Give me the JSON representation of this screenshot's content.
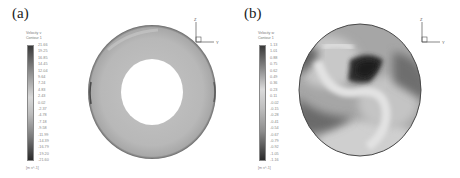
{
  "figure": {
    "panels": [
      {
        "label": "(a)",
        "legend": {
          "title_line1": "Velocity v",
          "title_line2": "Contour 1",
          "units": "[m s^-1]",
          "ticks": [
            "21.66",
            "19.25",
            "16.85",
            "14.45",
            "12.04",
            "9.64",
            "7.24",
            "4.83",
            "2.43",
            "0.02",
            "-2.37",
            "-4.78",
            "-7.18",
            "-9.58",
            "-11.99",
            "-14.39",
            "-16.79",
            "-19.20",
            "-21.60"
          ]
        },
        "contour_shape": "annulus",
        "axis_triad": {
          "vertical": "Z",
          "horizontal": "Y"
        }
      },
      {
        "label": "(b)",
        "legend": {
          "title_line1": "Velocity w",
          "title_line2": "Contour 1",
          "units": "[m s^-1]",
          "ticks": [
            "1.13",
            "1.01",
            "0.88",
            "0.75",
            "0.62",
            "0.49",
            "0.36",
            "0.23",
            "0.11",
            "-0.02",
            "-0.15",
            "-0.28",
            "-0.41",
            "-0.54",
            "-0.67",
            "-0.79",
            "-0.92",
            "-1.05",
            "-1.16"
          ]
        },
        "contour_shape": "disk",
        "axis_triad": {
          "vertical": "Z",
          "horizontal": "Y"
        }
      }
    ],
    "colors": {
      "colorbar_top": "#3a3a3a",
      "colorbar_mid": "#d8d8d8",
      "colorbar_bottom": "#2a2a2a",
      "field_gray": "#b4b4b4",
      "field_dark": "#3c3c3c",
      "field_light": "#dcdcdc"
    }
  }
}
